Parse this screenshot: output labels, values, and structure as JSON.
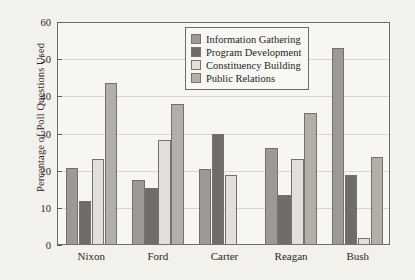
{
  "chart_data": {
    "type": "bar",
    "title": "",
    "xlabel": "",
    "ylabel": "Percentage of Poll Questions Used",
    "ylim": [
      0,
      60
    ],
    "yticks": [
      0,
      10,
      20,
      30,
      40,
      50,
      60
    ],
    "grid": true,
    "legend_position": "top-center",
    "categories": [
      "Nixon",
      "Ford",
      "Carter",
      "Reagan",
      "Bush"
    ],
    "series": [
      {
        "name": "Information Gathering",
        "color": "#9d9a95",
        "values": [
          20.7,
          17.5,
          20.5,
          26.3,
          53.2
        ]
      },
      {
        "name": "Program Development",
        "color": "#6f6c69",
        "values": [
          11.8,
          15.5,
          30.0,
          13.5,
          18.8
        ]
      },
      {
        "name": "Constituency Building",
        "color": "#e2e0d9",
        "values": [
          23.2,
          28.4,
          19.0,
          23.3,
          2.0
        ]
      },
      {
        "name": "Public Relations",
        "color": "#b2afa9",
        "values": [
          43.8,
          38.2,
          0.0,
          35.6,
          23.7
        ]
      }
    ]
  }
}
